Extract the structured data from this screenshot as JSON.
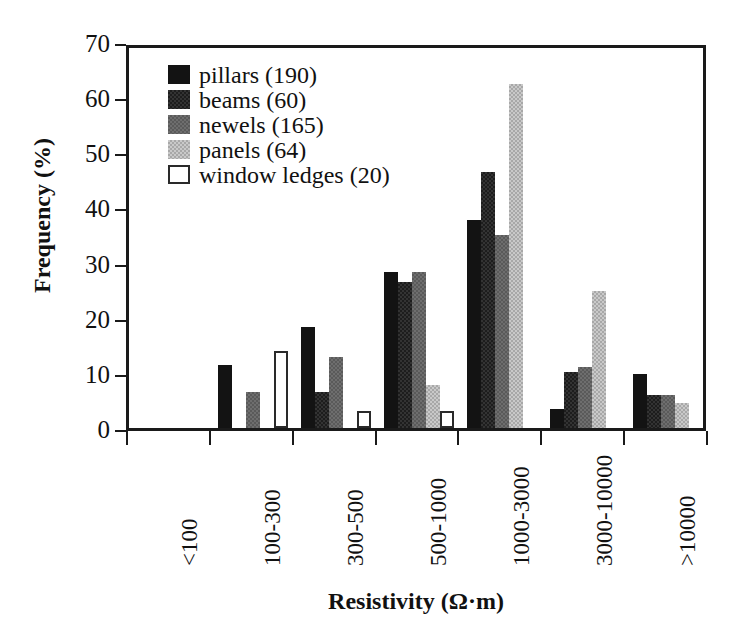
{
  "chart_data": {
    "type": "bar",
    "title": "",
    "xlabel": "Resistivity (Ω·m)",
    "ylabel": "Frequency (%)",
    "ylim": [
      0,
      70
    ],
    "yticks": [
      0,
      10,
      20,
      30,
      40,
      50,
      60,
      70
    ],
    "ytick_labels": [
      "0",
      "10",
      "20",
      "30",
      "40",
      "50",
      "60",
      "70"
    ],
    "grid": false,
    "legend_position": "upper-left-inside",
    "categories": [
      "<100",
      "100-300",
      "300-500",
      "500-1000",
      "1000-3000",
      "3000-10000",
      ">10000"
    ],
    "series": [
      {
        "name": "pillars (190)",
        "key": "pillars",
        "count": 190,
        "color": "#131313",
        "values": [
          0,
          11.5,
          18.3,
          28.3,
          37.7,
          3.5,
          9.8
        ]
      },
      {
        "name": "beams (60)",
        "key": "beams",
        "count": 60,
        "color": "#333333",
        "values": [
          0,
          0,
          6.5,
          26.5,
          46.5,
          10.2,
          5.9
        ]
      },
      {
        "name": "newels (165)",
        "key": "newels",
        "count": 165,
        "color": "#6e6e6e",
        "values": [
          0,
          6.5,
          12.8,
          28.3,
          35.0,
          11.0,
          5.9
        ]
      },
      {
        "name": "panels (64)",
        "key": "panels",
        "count": 64,
        "color": "#c9c9c9",
        "values": [
          0,
          0,
          0,
          7.8,
          62.3,
          24.9,
          4.5
        ]
      },
      {
        "name": "window ledges (20)",
        "key": "ledges",
        "count": 20,
        "color": "#ffffff",
        "values": [
          0,
          14.0,
          3.0,
          3.0,
          0,
          0,
          0
        ]
      }
    ]
  },
  "axes": {
    "x_title": "Resistivity (Ω·m)",
    "y_title": "Frequency (%)"
  },
  "legend": {
    "items": [
      {
        "label": "pillars (190)",
        "swatch": "pillars"
      },
      {
        "label": "beams (60)",
        "swatch": "beams"
      },
      {
        "label": "newels (165)",
        "swatch": "newels"
      },
      {
        "label": "panels (64)",
        "swatch": "panels"
      },
      {
        "label": "window ledges (20)",
        "swatch": "ledges"
      }
    ]
  }
}
